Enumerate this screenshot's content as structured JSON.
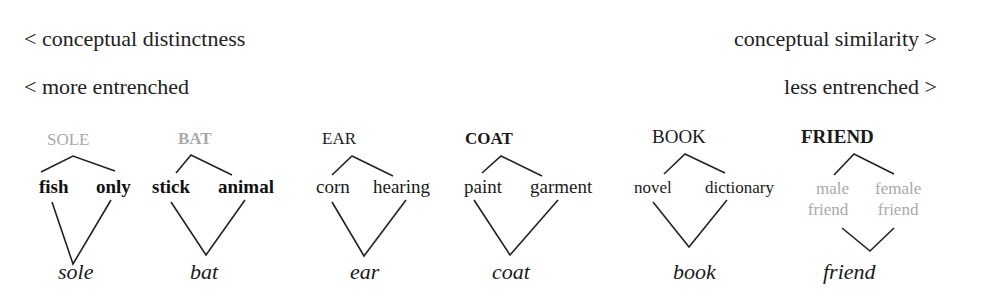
{
  "header": {
    "left_top": "< conceptual distinctness",
    "right_top": "conceptual similarity >",
    "left_bottom": "< more entrenched",
    "right_bottom": "less entrenched >"
  },
  "clusters": [
    {
      "id": "sole",
      "head": "SOLE",
      "head_style": "grey",
      "senses": [
        "fish",
        "only"
      ],
      "sense_style": "bold",
      "form": "sole"
    },
    {
      "id": "bat",
      "head": "BAT",
      "head_style": "grey-bold",
      "senses": [
        "stick",
        "animal"
      ],
      "sense_style": "bold",
      "form": "bat"
    },
    {
      "id": "ear",
      "head": "EAR",
      "head_style": "regular",
      "senses": [
        "corn",
        "hearing"
      ],
      "sense_style": "regular",
      "form": "ear"
    },
    {
      "id": "coat",
      "head": "COAT",
      "head_style": "bold",
      "senses": [
        "paint",
        "garment"
      ],
      "sense_style": "regular",
      "form": "coat"
    },
    {
      "id": "book",
      "head": "BOOK",
      "head_style": "regular",
      "senses": [
        "novel",
        "dictionary"
      ],
      "sense_style": "regular",
      "form": "book"
    },
    {
      "id": "friend",
      "head": "FRIEND",
      "head_style": "bold",
      "senses": [
        "male friend",
        "female friend"
      ],
      "sense_lines": [
        [
          "male",
          "friend"
        ],
        [
          "female",
          "friend"
        ]
      ],
      "sense_style": "grey",
      "form": "friend"
    }
  ],
  "colors": {
    "text": "#1a1a1a",
    "grey_text": "#a9a9a9",
    "lines": "#222222",
    "background": "#ffffff"
  }
}
